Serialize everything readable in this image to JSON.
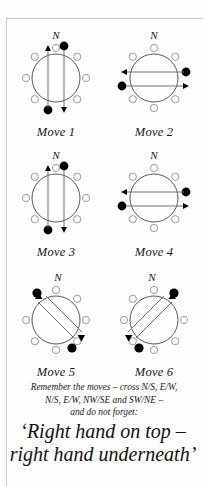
{
  "page": {
    "background_color": "#fefefe",
    "frame_color": "#c9c9c9"
  },
  "diagram": {
    "compass_label": "N",
    "ring_count": 8,
    "open_bell_color": "#ffffff",
    "open_bell_stroke": "#9a9a9a",
    "filled_bell_color": "#000000",
    "circle_stroke": "#5a5a5a",
    "path_stroke": "#6e6e6e",
    "moves": [
      {
        "id": "move-1",
        "label": "Move 1",
        "axis": "N/S",
        "orientation": "vertical",
        "filled_positions": [
          "NNE",
          "SSW"
        ],
        "arrow_directions": [
          "up",
          "down"
        ]
      },
      {
        "id": "move-2",
        "label": "Move 2",
        "axis": "E/W",
        "orientation": "horizontal",
        "filled_positions": [
          "ENE",
          "WSW"
        ],
        "arrow_directions": [
          "left",
          "right"
        ]
      },
      {
        "id": "move-3",
        "label": "Move 3",
        "axis": "N/S",
        "orientation": "vertical",
        "filled_positions": [
          "NNE",
          "SSW"
        ],
        "arrow_directions": [
          "up",
          "down"
        ]
      },
      {
        "id": "move-4",
        "label": "Move 4",
        "axis": "E/W",
        "orientation": "horizontal",
        "filled_positions": [
          "ENE",
          "WSW"
        ],
        "arrow_directions": [
          "left",
          "right"
        ]
      },
      {
        "id": "move-5",
        "label": "Move 5",
        "axis": "NW/SE",
        "orientation": "diagonal-nwse",
        "filled_positions": [
          "NW",
          "SE"
        ],
        "arrow_directions": [
          "up-left",
          "down-right"
        ]
      },
      {
        "id": "move-6",
        "label": "Move 6",
        "axis": "SW/NE",
        "orientation": "diagonal-swne",
        "filled_positions": [
          "NE",
          "SW"
        ],
        "arrow_directions": [
          "up-right",
          "down-left"
        ]
      }
    ]
  },
  "caption": {
    "lines": [
      "Remember the moves – cross N/S, E/W,",
      "N/S, E/W, NW/SE and SW/NE –",
      "and do not forget:"
    ]
  },
  "shout": {
    "lines": [
      "‘Right hand on top –",
      "right hand underneath’"
    ]
  }
}
